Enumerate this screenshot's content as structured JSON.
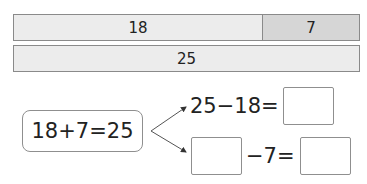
{
  "bar_model": {
    "top_bar": {
      "segments": [
        {
          "label": "18",
          "value": 18
        },
        {
          "label": "7",
          "value": 7
        }
      ]
    },
    "bottom_bar": {
      "label": "25",
      "value": 25
    }
  },
  "known_equation": "18+7=25",
  "derived_equations": [
    {
      "left": "25−18=",
      "answer": ""
    },
    {
      "blank": "",
      "middle": "−7=",
      "answer": ""
    }
  ],
  "colors": {
    "bar_light": "#ececec",
    "bar_dark": "#d6d6d6",
    "border": "#8a8a8a"
  }
}
